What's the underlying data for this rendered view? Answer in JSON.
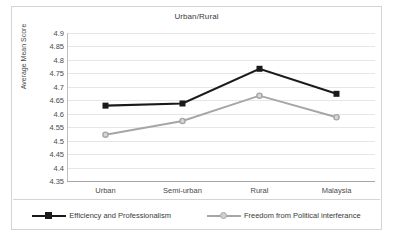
{
  "chart_data": {
    "type": "line",
    "title": "Urban/Rural",
    "xlabel": "",
    "ylabel": "Average Mean Score",
    "categories": [
      "Urban",
      "Semi-urban",
      "Rural",
      "Malaysia"
    ],
    "ylim": [
      4.35,
      4.9
    ],
    "ytick_labels": [
      "4.9",
      "4.85",
      "4.8",
      "4.75",
      "4.7",
      "4.65",
      "4.6",
      "4.55",
      "4.5",
      "4.45",
      "4.4",
      "4.35"
    ],
    "ytick_values": [
      4.9,
      4.85,
      4.8,
      4.75,
      4.7,
      4.65,
      4.6,
      4.55,
      4.5,
      4.45,
      4.4,
      4.35
    ],
    "grid": true,
    "legend_position": "bottom",
    "series": [
      {
        "name": "Efficiency and Professionalism",
        "color": "#1a1a1a",
        "marker": "square",
        "values": [
          4.63,
          4.638,
          4.767,
          4.674
        ]
      },
      {
        "name": "Freedom from Political interferance",
        "color": "#a6a6a6",
        "marker": "circle",
        "values": [
          4.522,
          4.573,
          4.667,
          4.587
        ]
      }
    ]
  },
  "legend": {
    "items": [
      {
        "label": "Efficiency and Professionalism"
      },
      {
        "label": "Freedom from Political interferance"
      }
    ]
  },
  "colors": {
    "series_1": "#1a1a1a",
    "series_2": "#a6a6a6",
    "grid": "#e6e6e6",
    "axis": "#a6a6a6",
    "text": "#404040",
    "background": "#ffffff"
  }
}
